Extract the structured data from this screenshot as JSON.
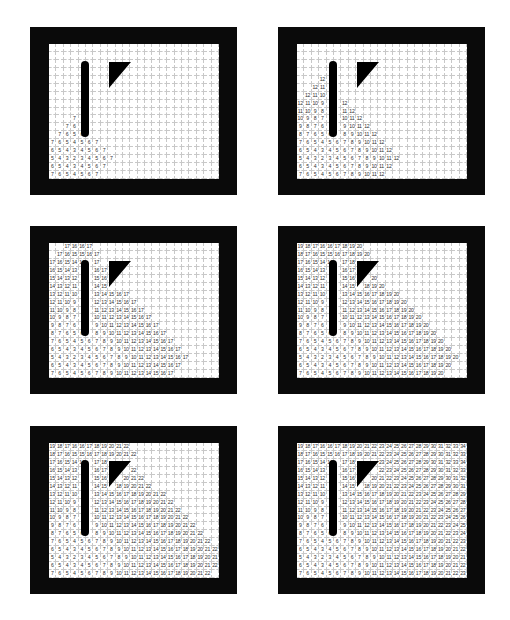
{
  "figure": {
    "grid": {
      "cols": 23,
      "rows": 17
    },
    "source_cell": {
      "col": 3,
      "row": 14,
      "value": 2
    },
    "colors": {
      "frame": "#0a0a0a",
      "grid_bg": "#ffffff",
      "grid_line": "#c8c8c8",
      "text": "#333333",
      "obstacle": "#000000"
    },
    "obstacles": [
      {
        "name": "vertical-bar",
        "cols": [
          4,
          5
        ],
        "rows": [
          3,
          11
        ]
      },
      {
        "name": "triangle",
        "cols": [
          8,
          10
        ],
        "rows": [
          3,
          5
        ]
      }
    ],
    "distance_rows": [
      "19 18 17 16 16 17 18 19 20 21 22 23 24 25 26 27 28 29 30 31 32 33 34",
      "18 17 16 15 15 16 17 18 19 20 21 22 23 24 25 26 27 28 29 30 31 32 33",
      "17 16 15 14 14 _ 17 18 _ _ _ 23 24 25 26 27 28 29 30 31 32 33 34",
      "16 15 14 13 _ _ 16 17 _ _ _ 22 23 24 25 26 27 28 29 30 31 32 33",
      "15 14 13 12 _ _ 15 16 _ _ 20 21 22 23 24 25 26 27 28 29 30 31 32",
      "14 13 12 11 _ _ 14 15 _ 18 19 20 21 22 23 24 25 26 27 28 29 30 31",
      "13 12 11 10 _ _ 13 14 15 16 17 18 19 20 21 22 23 24 25 26 27 28 29",
      "12 11 10 9 _ _ 12 13 14 15 16 17 18 19 20 21 22 23 24 25 26 27 28",
      "11 10 9 8 _ _ 11 12 13 14 15 16 17 18 19 20 21 22 23 24 25 26 27",
      "10 9 8 7 _ _ 10 11 12 13 14 15 16 17 18 19 20 21 22 23 24 25 26",
      "9 8 7 6 _ _ 9 10 11 12 13 14 15 16 17 18 19 20 21 22 23 24 25",
      "8 7 6 5 6 _ 8 9 10 11 12 13 14 15 16 17 18 19 20 21 22 23 24",
      "7 6 5 4 5 6 7 8 9 10 11 12 13 14 15 16 17 18 19 20 21 22 23",
      "6 5 4 3 4 5 6 7 8 9 10 11 12 13 14 15 16 17 18 19 20 21 22",
      "5 4 3 2 3 4 5 6 7 8 9 10 11 12 13 14 15 16 17 18 19 20 21",
      "6 5 4 3 4 5 6 7 8 9 10 11 12 13 14 15 16 17 18 19 20 21 22",
      "7 6 5 4 5 6 7 8 9 10 11 12 13 14 15 16 17 18 19 20 21 22 23"
    ],
    "panels": [
      {
        "id": "panel-1",
        "position": "top-left",
        "max_value_shown": 7
      },
      {
        "id": "panel-2",
        "position": "top-right",
        "max_value_shown": 12
      },
      {
        "id": "panel-3",
        "position": "middle-left",
        "max_value_shown": 17
      },
      {
        "id": "panel-4",
        "position": "middle-right",
        "max_value_shown": 20
      },
      {
        "id": "panel-5",
        "position": "bottom-left",
        "max_value_shown": 22
      },
      {
        "id": "panel-6",
        "position": "bottom-right",
        "max_value_shown": 34
      }
    ]
  }
}
